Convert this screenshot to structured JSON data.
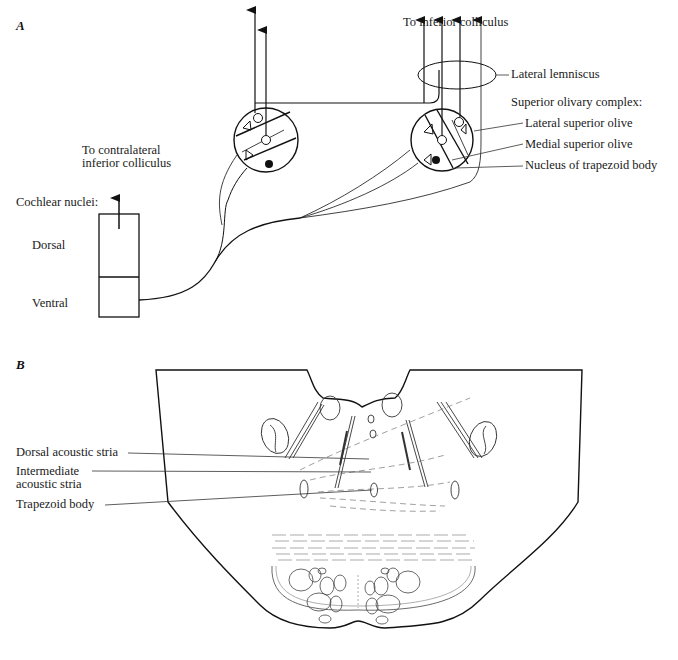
{
  "panel_a": {
    "letter": "A",
    "labels": {
      "to_contralateral": [
        "To contralateral",
        "inferior colliculus"
      ],
      "cochlear_nuclei": "Cochlear nuclei:",
      "dorsal": "Dorsal",
      "ventral": "Ventral",
      "to_inferior_colliculus": "To inferior colliculus",
      "lateral_lemniscus": "Lateral lemniscus",
      "superior_olivary_complex": "Superior olivary complex:",
      "lateral_superior_olive": "Lateral superior olive",
      "medial_superior_olive": "Medial superior olive",
      "nucleus_trapezoid_body": "Nucleus of trapezoid body"
    }
  },
  "panel_b": {
    "letter": "B",
    "labels": {
      "dorsal_acoustic_stria": "Dorsal acoustic stria",
      "intermediate_acoustic_stria": [
        "Intermediate",
        "acoustic stria"
      ],
      "trapezoid_body": "Trapezoid body"
    }
  }
}
